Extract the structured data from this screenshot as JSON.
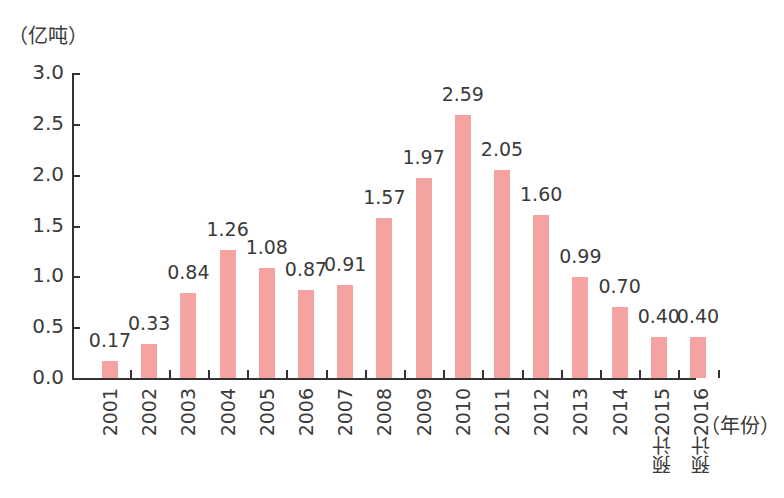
{
  "chart_data": {
    "type": "bar",
    "title": "",
    "ylabel": "（亿吨）",
    "xlabel": "（年份）",
    "ylim": [
      0,
      3.0
    ],
    "yticks": [
      "0.0",
      "0.5",
      "1.0",
      "1.5",
      "2.0",
      "2.5",
      "3.0"
    ],
    "categories": [
      "2001",
      "2002",
      "2003",
      "2004",
      "2005",
      "2006",
      "2007",
      "2008",
      "2009",
      "2010",
      "2011",
      "2012",
      "2013",
      "2014",
      "预计2015",
      "预计2016"
    ],
    "values": [
      0.17,
      0.33,
      0.84,
      1.26,
      1.08,
      0.87,
      0.91,
      1.57,
      1.97,
      2.59,
      2.05,
      1.6,
      0.99,
      0.7,
      0.4,
      0.4
    ],
    "labels": [
      "0.17",
      "0.33",
      "0.84",
      "1.26",
      "1.08",
      "0.87",
      "0.91",
      "1.57",
      "1.97",
      "2.59",
      "2.05",
      "1.60",
      "0.99",
      "0.70",
      "0.40",
      "0.40"
    ],
    "bar_color": "#f4a3a0",
    "grid": false,
    "legend": null
  }
}
